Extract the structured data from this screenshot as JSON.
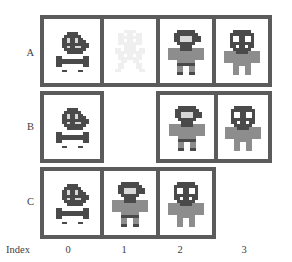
{
  "figure": {
    "axis_label": "Index",
    "index_ticks": [
      "0",
      "1",
      "2",
      "3"
    ],
    "row_labels": [
      "A",
      "B",
      "C"
    ],
    "colors": {
      "box_outline": "#5b5b5b",
      "cell_background": "#ffffff",
      "page_background": "#ffffff",
      "text": "#3d3d3d",
      "sprite_dark": "#4a4a4a",
      "sprite_body": "#8d8d8d",
      "sprite_light": "#d8d8d8",
      "sprite_pale": "#efefef"
    }
  },
  "rows": [
    {
      "label": "A",
      "groups": [
        {
          "start_index": 0,
          "span": 4,
          "cells": [
            {
              "index": "0",
              "sprite": "dark-helmet-skull",
              "tone": "dark"
            },
            {
              "index": "1",
              "sprite": "pale-creature",
              "tone": "pale"
            },
            {
              "index": "2",
              "sprite": "gray-humanoid-hat",
              "tone": "mid"
            },
            {
              "index": "3",
              "sprite": "gray-robot-eyes",
              "tone": "mid"
            }
          ]
        }
      ]
    },
    {
      "label": "B",
      "groups": [
        {
          "start_index": 0,
          "span": 1,
          "cells": [
            {
              "index": "0",
              "sprite": "dark-helmet-skull",
              "tone": "dark"
            }
          ]
        },
        {
          "start_index": 2,
          "span": 2,
          "cells": [
            {
              "index": "2",
              "sprite": "gray-humanoid-hat",
              "tone": "mid"
            },
            {
              "index": "3",
              "sprite": "gray-robot-eyes",
              "tone": "mid"
            }
          ]
        }
      ]
    },
    {
      "label": "C",
      "groups": [
        {
          "start_index": 0,
          "span": 3,
          "cells": [
            {
              "index": "0",
              "sprite": "dark-helmet-skull",
              "tone": "dark"
            },
            {
              "index": "1",
              "sprite": "gray-humanoid-hat",
              "tone": "mid"
            },
            {
              "index": "2",
              "sprite": "gray-robot-eyes",
              "tone": "mid"
            }
          ]
        }
      ]
    }
  ]
}
